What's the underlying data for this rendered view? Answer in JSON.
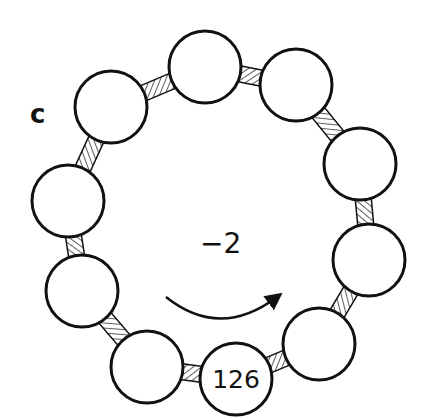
{
  "diagram": {
    "panel_label": "c",
    "center_label": "−2",
    "direction": "clockwise",
    "bead_count": 10,
    "beads": [
      {
        "id": 1,
        "cx": 111,
        "cy": 107,
        "label": ""
      },
      {
        "id": 2,
        "cx": 205,
        "cy": 67,
        "label": ""
      },
      {
        "id": 3,
        "cx": 296,
        "cy": 85,
        "label": ""
      },
      {
        "id": 4,
        "cx": 360,
        "cy": 164,
        "label": ""
      },
      {
        "id": 5,
        "cx": 369,
        "cy": 260,
        "label": ""
      },
      {
        "id": 6,
        "cx": 319,
        "cy": 344,
        "label": ""
      },
      {
        "id": 7,
        "cx": 236,
        "cy": 379,
        "label": "126"
      },
      {
        "id": 8,
        "cx": 147,
        "cy": 367,
        "label": ""
      },
      {
        "id": 9,
        "cx": 82,
        "cy": 291,
        "label": ""
      },
      {
        "id": 10,
        "cx": 68,
        "cy": 201,
        "label": ""
      }
    ],
    "bead_radius": 36,
    "colors": {
      "stroke": "#111111",
      "fill": "#ffffff",
      "hatch": "#333333"
    }
  }
}
